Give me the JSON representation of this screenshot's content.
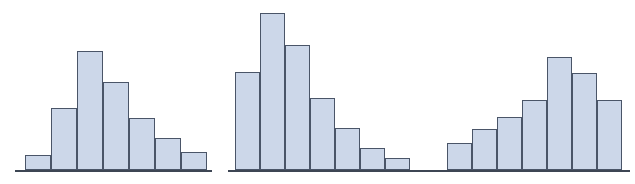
{
  "figure": {
    "title": "",
    "background_color": "#ffffff",
    "width": 635,
    "height": 184,
    "bar_fill_color": "#ccd7e9",
    "bar_border_color": "#4a5568",
    "axis_color": "#3d4654",
    "baseline_y": 170
  },
  "chart_data": [
    {
      "type": "bar",
      "name": "histogram-right-skewed",
      "title": "",
      "subtitle": "",
      "xlabel": "",
      "ylabel": "",
      "shape": "right-skewed",
      "categories": [
        "1",
        "2",
        "3",
        "4",
        "5",
        "6",
        "7"
      ],
      "values": [
        15,
        62,
        119,
        88,
        52,
        32,
        18
      ],
      "ylim": [
        0,
        125
      ],
      "xlim": [
        0,
        7
      ],
      "grid": false,
      "legend": null,
      "axis": {
        "x_start": 15,
        "x_end": 212,
        "y": 170
      },
      "bars": [
        {
          "x": 25,
          "width": 26,
          "top": 155,
          "height": 15
        },
        {
          "x": 51,
          "width": 26,
          "top": 108,
          "height": 62
        },
        {
          "x": 77,
          "width": 26,
          "top": 51,
          "height": 119
        },
        {
          "x": 103,
          "width": 26,
          "top": 82,
          "height": 88
        },
        {
          "x": 129,
          "width": 26,
          "top": 118,
          "height": 52
        },
        {
          "x": 155,
          "width": 26,
          "top": 138,
          "height": 32
        },
        {
          "x": 181,
          "width": 26,
          "top": 152,
          "height": 18
        }
      ]
    },
    {
      "type": "bar",
      "name": "histogram-right-skewed-tall",
      "title": "",
      "subtitle": "",
      "xlabel": "",
      "ylabel": "",
      "shape": "right-skewed",
      "categories": [
        "1",
        "2",
        "3",
        "4",
        "5",
        "6",
        "7"
      ],
      "values": [
        98,
        157,
        125,
        72,
        42,
        22,
        12
      ],
      "ylim": [
        0,
        160
      ],
      "xlim": [
        0,
        7
      ],
      "grid": false,
      "legend": null,
      "axis": {
        "x_start": 228,
        "x_end": 422,
        "y": 170
      },
      "bars": [
        {
          "x": 235,
          "width": 25,
          "top": 72,
          "height": 98
        },
        {
          "x": 260,
          "width": 25,
          "top": 13,
          "height": 157
        },
        {
          "x": 285,
          "width": 25,
          "top": 45,
          "height": 125
        },
        {
          "x": 310,
          "width": 25,
          "top": 98,
          "height": 72
        },
        {
          "x": 335,
          "width": 25,
          "top": 128,
          "height": 42
        },
        {
          "x": 360,
          "width": 25,
          "top": 148,
          "height": 22
        },
        {
          "x": 385,
          "width": 25,
          "top": 158,
          "height": 12
        }
      ]
    },
    {
      "type": "bar",
      "name": "histogram-left-skewed",
      "title": "",
      "subtitle": "",
      "xlabel": "",
      "ylabel": "",
      "shape": "left-skewed",
      "categories": [
        "1",
        "2",
        "3",
        "4",
        "5",
        "6",
        "7"
      ],
      "values": [
        27,
        41,
        53,
        70,
        113,
        97,
        70
      ],
      "ylim": [
        0,
        120
      ],
      "xlim": [
        0,
        7
      ],
      "grid": false,
      "legend": null,
      "axis": {
        "x_start": 421,
        "x_end": 630,
        "y": 170
      },
      "bars": [
        {
          "x": 447,
          "width": 25,
          "top": 143,
          "height": 27
        },
        {
          "x": 472,
          "width": 25,
          "top": 129,
          "height": 41
        },
        {
          "x": 497,
          "width": 25,
          "top": 117,
          "height": 53
        },
        {
          "x": 522,
          "width": 25,
          "top": 100,
          "height": 70
        },
        {
          "x": 547,
          "width": 25,
          "top": 57,
          "height": 113
        },
        {
          "x": 572,
          "width": 25,
          "top": 73,
          "height": 97
        },
        {
          "x": 597,
          "width": 25,
          "top": 100,
          "height": 70
        }
      ]
    }
  ]
}
